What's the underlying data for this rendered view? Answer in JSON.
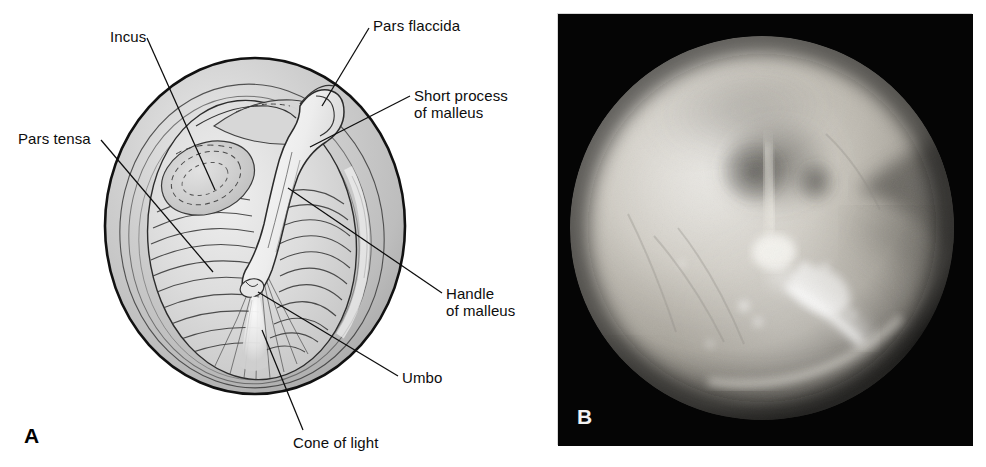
{
  "figure": {
    "panels": [
      {
        "letter": "A",
        "kind": "line-drawing",
        "subject": "tympanic-membrane-diagram",
        "labels": [
          {
            "name": "incus",
            "text": "Incus",
            "x": 110,
            "y": 29
          },
          {
            "name": "pars-flaccida",
            "text": "Pars flaccida",
            "x": 373,
            "y": 18
          },
          {
            "name": "short-process",
            "text": "Short process",
            "x": 414,
            "y": 88
          },
          {
            "name": "short-process-2",
            "text": "of malleus",
            "x": 414,
            "y": 105
          },
          {
            "name": "pars-tensa",
            "text": "Pars tensa",
            "x": 18,
            "y": 131
          },
          {
            "name": "handle-of-malleus",
            "text": "Handle",
            "x": 446,
            "y": 286
          },
          {
            "name": "handle-of-malleus-2",
            "text": "of malleus",
            "x": 446,
            "y": 303
          },
          {
            "name": "umbo",
            "text": "Umbo",
            "x": 402,
            "y": 370
          },
          {
            "name": "cone-of-light",
            "text": "Cone of light",
            "x": 293,
            "y": 435
          }
        ],
        "letter_pos": {
          "x": 24,
          "y": 425
        }
      },
      {
        "letter": "B",
        "kind": "otoscopic-photograph",
        "subject": "normal-tympanic-membrane",
        "labels": [],
        "letter_pos": {
          "x": 576,
          "y": 418
        }
      }
    ]
  },
  "colors": {
    "background": "#ffffff",
    "ink": "#0d0d0d",
    "drum_fill": "#c9c9c9",
    "drum_light": "#e6e6e6",
    "drum_shadow": "#a8a8a8",
    "photo_frame": "#050505",
    "photo_tissue": "#b9b5ad",
    "photo_highlight": "#ffffff",
    "panel_letter_dark": "#000000",
    "panel_letter_light": "#f2f2f2"
  }
}
